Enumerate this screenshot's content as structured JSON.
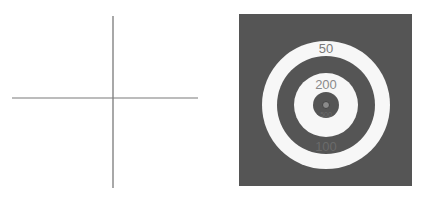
{
  "crosshair": {
    "line_color": "#6e6e6e",
    "vertical": {
      "x": 113,
      "y1": 16,
      "y2": 188
    },
    "horizontal": {
      "y": 98,
      "x1": 12,
      "x2": 198
    }
  },
  "target": {
    "background_color": "#555555",
    "light_color": "#f7f7f7",
    "dark_color": "#555555",
    "label_color": "#7a7a7a",
    "center_dot_color": "#8a8a8a",
    "rings": [
      {
        "label": "50",
        "color": "light"
      },
      {
        "label": "100",
        "color": "dark"
      },
      {
        "label": "200",
        "color": "light"
      },
      {
        "label": "500",
        "color": "dark"
      }
    ],
    "labels": {
      "outer": "50",
      "second": "200",
      "third": "100",
      "inner": "500"
    }
  }
}
